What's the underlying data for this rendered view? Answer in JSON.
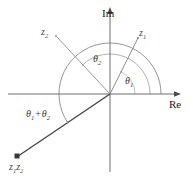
{
  "figure": {
    "background": "#ffffff",
    "width": 193,
    "height": 179
  },
  "axes": {
    "imaginary_label": "Im",
    "real_label": "Re",
    "origin": {
      "x": 110,
      "y": 94
    },
    "real_axis": {
      "x1": 8,
      "y1": 94,
      "x2": 181,
      "y2": 94
    },
    "imaginary_axis": {
      "x1": 110,
      "y1": 8,
      "x2": 110,
      "y2": 172
    },
    "color": "#6e6e6e"
  },
  "vectors": [
    {
      "name": "z1",
      "label_main": "z",
      "label_sub": "1",
      "tip": {
        "x": 138,
        "y": 38
      },
      "angle_deg": 63,
      "color": "#8c8c8c",
      "width": 1
    },
    {
      "name": "z2",
      "label_main": "z",
      "label_sub": "2",
      "tip": {
        "x": 56,
        "y": 36
      },
      "angle_deg": 133,
      "color": "#9a9a9a",
      "width": 1
    },
    {
      "name": "z1z2",
      "label_main": "z",
      "label_sub": "1",
      "label_main2": "z",
      "label_sub2": "2",
      "tip": {
        "x": 17,
        "y": 157
      },
      "angle_deg": 214,
      "color": "#4a4a4a",
      "width": 1.6
    }
  ],
  "angles": [
    {
      "name": "theta1",
      "label_main": "θ",
      "label_sub": "1",
      "radius": 25,
      "from_deg": 0,
      "to_deg": 63,
      "color": "#b0b0b0"
    },
    {
      "name": "theta2",
      "label_main": "θ",
      "label_sub": "2",
      "radius": 40,
      "from_deg": 0,
      "to_deg": 133,
      "color": "#a0a0a0"
    },
    {
      "name": "theta1_plus_theta2",
      "label_main": "θ",
      "label_sub": "1",
      "label_op": "+",
      "label_main2": "θ",
      "label_sub2": "2",
      "radius": 51,
      "from_deg": 0,
      "to_deg": 214,
      "color": "#8a8a8a"
    }
  ]
}
